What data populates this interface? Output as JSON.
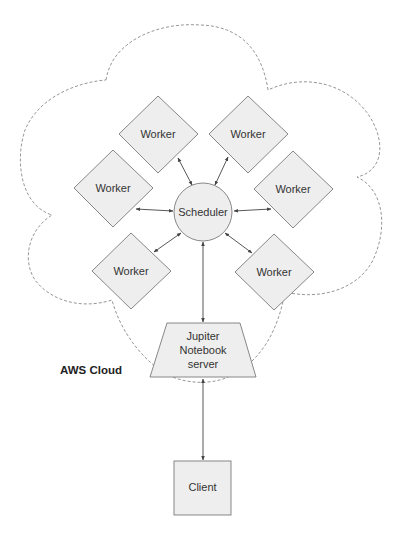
{
  "diagram": {
    "cloud_label": "AWS Cloud",
    "scheduler": {
      "label": "Scheduler"
    },
    "workers": [
      {
        "label": "Worker",
        "position": "top-left"
      },
      {
        "label": "Worker",
        "position": "top-right"
      },
      {
        "label": "Worker",
        "position": "left"
      },
      {
        "label": "Worker",
        "position": "right"
      },
      {
        "label": "Worker",
        "position": "bottom-left"
      },
      {
        "label": "Worker",
        "position": "bottom-right"
      }
    ],
    "notebook_server": {
      "lines": [
        "Jupiter",
        "Notebook",
        "server"
      ]
    },
    "client": {
      "label": "Client"
    },
    "connections": [
      {
        "from": "Scheduler",
        "to": "Worker (top-left)",
        "type": "bidirectional"
      },
      {
        "from": "Scheduler",
        "to": "Worker (top-right)",
        "type": "bidirectional"
      },
      {
        "from": "Scheduler",
        "to": "Worker (left)",
        "type": "bidirectional"
      },
      {
        "from": "Scheduler",
        "to": "Worker (right)",
        "type": "bidirectional"
      },
      {
        "from": "Scheduler",
        "to": "Worker (bottom-left)",
        "type": "bidirectional"
      },
      {
        "from": "Scheduler",
        "to": "Worker (bottom-right)",
        "type": "bidirectional"
      },
      {
        "from": "Scheduler",
        "to": "Jupiter Notebook server",
        "type": "bidirectional"
      },
      {
        "from": "Jupiter Notebook server",
        "to": "Client",
        "type": "bidirectional"
      }
    ],
    "colors": {
      "node_fill": "#eeeeee",
      "node_stroke": "#7a7a7a",
      "cloud_stroke": "#8a8a8a",
      "arrow": "#444444",
      "text": "#333333"
    }
  }
}
